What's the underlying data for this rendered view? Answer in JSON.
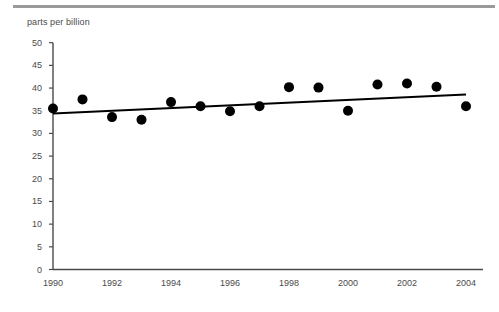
{
  "chart_data": {
    "type": "scatter",
    "title": "",
    "subtitle": "",
    "ylabel": "parts per billion",
    "xlabel": "",
    "x": [
      1990,
      1991,
      1992,
      1993,
      1994,
      1995,
      1996,
      1997,
      1998,
      1999,
      2000,
      2001,
      2002,
      2003,
      2004
    ],
    "values": [
      35.5,
      37.5,
      33.6,
      33.0,
      36.9,
      36.0,
      34.9,
      36.0,
      40.2,
      40.1,
      35.0,
      40.8,
      41.0,
      40.3,
      36.0
    ],
    "series": [
      {
        "name": "observations",
        "type": "scatter",
        "marker": "filled-circle",
        "color": "#000000",
        "values": [
          35.5,
          37.5,
          33.6,
          33.0,
          36.9,
          36.0,
          34.9,
          36.0,
          40.2,
          40.1,
          35.0,
          40.8,
          41.0,
          40.3,
          36.0
        ]
      },
      {
        "name": "trend-line",
        "type": "line",
        "color": "#000000",
        "endpoints": [
          {
            "x": 1990,
            "y": 34.4
          },
          {
            "x": 2004,
            "y": 38.6
          }
        ]
      }
    ],
    "xlim": [
      1990,
      2004
    ],
    "ylim": [
      0,
      50
    ],
    "ytick_labels": [
      "0",
      "5",
      "10",
      "15",
      "20",
      "25",
      "30",
      "35",
      "40",
      "45",
      "50"
    ],
    "ytick_values": [
      0,
      5,
      10,
      15,
      20,
      25,
      30,
      35,
      40,
      45,
      50
    ],
    "xtick_labels": [
      "1990",
      "1992",
      "1994",
      "1996",
      "1998",
      "2000",
      "2002",
      "2004"
    ],
    "xtick_values": [
      1990,
      1992,
      1994,
      1996,
      1998,
      2000,
      2002,
      2004
    ],
    "grid": false,
    "legend": false,
    "legend_position": "none",
    "axis_color": "#4a4a4a",
    "marker_color": "#000000",
    "line_color": "#000000",
    "top_rule_color": "#9a9a9a"
  }
}
